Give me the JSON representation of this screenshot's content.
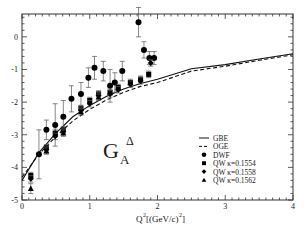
{
  "chart_data": {
    "type": "scatter",
    "title": "",
    "annotation": {
      "main": "G",
      "subscript": "A",
      "superscript": "Δ"
    },
    "xlabel": "Q²[(GeV/c)²]",
    "ylabel": "",
    "xlim": [
      0,
      4
    ],
    "ylim": [
      -5,
      0.7
    ],
    "xticks": [
      0,
      1,
      2,
      3,
      4
    ],
    "yticks": [
      0,
      -1,
      -2,
      -3,
      -4,
      -5
    ],
    "grid": false,
    "legend_position": "lower right",
    "legend": [
      {
        "label": "GBE",
        "style": "solid-line"
      },
      {
        "label": "OGE",
        "style": "dashed-line"
      },
      {
        "label": "DWF",
        "style": "circle"
      },
      {
        "label": "QW κ=0.1554",
        "style": "square"
      },
      {
        "label": "QW κ=0.1558",
        "style": "diamond"
      },
      {
        "label": "QW κ=0.1562",
        "style": "triangle"
      }
    ],
    "series": [
      {
        "name": "GBE",
        "type": "line",
        "dash": false,
        "x": [
          0,
          0.25,
          0.5,
          0.75,
          1.0,
          1.25,
          1.5,
          1.75,
          2.0,
          2.5,
          3.0,
          3.5,
          4.0
        ],
        "y": [
          -4.4,
          -3.55,
          -2.95,
          -2.45,
          -2.1,
          -1.82,
          -1.6,
          -1.43,
          -1.3,
          -0.98,
          -0.85,
          -0.68,
          -0.52
        ]
      },
      {
        "name": "OGE",
        "type": "line",
        "dash": true,
        "x": [
          0,
          0.25,
          0.5,
          0.75,
          1.0,
          1.25,
          1.5,
          1.75,
          2.0,
          2.5,
          3.0,
          3.5,
          4.0
        ],
        "y": [
          -4.3,
          -3.6,
          -3.05,
          -2.58,
          -2.22,
          -1.93,
          -1.7,
          -1.52,
          -1.4,
          -1.05,
          -0.9,
          -0.72,
          -0.55
        ]
      },
      {
        "name": "DWF",
        "marker": "circle",
        "x": [
          0.25,
          0.36,
          0.49,
          0.61,
          0.73,
          0.87,
          0.98,
          1.07,
          1.2,
          1.3,
          1.37,
          1.48,
          1.72,
          1.8,
          1.88,
          1.95
        ],
        "y": [
          -3.6,
          -2.85,
          -2.7,
          -2.45,
          -1.9,
          -1.75,
          -1.25,
          -0.95,
          -1.05,
          -1.5,
          -1.4,
          -1.05,
          0.45,
          -0.4,
          -0.65,
          -0.65
        ],
        "err": [
          0.75,
          0.3,
          0.65,
          0.5,
          0.4,
          0.35,
          0.3,
          0.35,
          0.3,
          0.5,
          0.3,
          0.3,
          0.45,
          0.25,
          0.2,
          0.2
        ]
      },
      {
        "name": "QW κ=0.1554",
        "marker": "square",
        "x": [
          0.13,
          0.36,
          0.49,
          0.61,
          0.87,
          1.0,
          1.13,
          1.3,
          1.42,
          1.6,
          1.75,
          1.87
        ],
        "y": [
          -4.25,
          -3.4,
          -2.95,
          -2.85,
          -2.2,
          -1.95,
          -1.75,
          -1.7,
          -1.55,
          -1.4,
          -1.3,
          -1.15
        ],
        "err": [
          0.1,
          0.1,
          0.12,
          0.1,
          0.1,
          0.1,
          0.1,
          0.1,
          0.1,
          0.1,
          0.1,
          0.1
        ]
      },
      {
        "name": "QW κ=0.1558",
        "marker": "diamond",
        "x": [
          0.13,
          0.36,
          0.49,
          0.61,
          0.87,
          1.0,
          1.13,
          1.3,
          1.42,
          1.6,
          1.75,
          1.9
        ],
        "y": [
          -4.35,
          -3.45,
          -3.05,
          -2.9,
          -2.25,
          -2.05,
          -1.8,
          -1.75,
          -1.62,
          -1.45,
          -1.35,
          -0.8
        ],
        "err": [
          0.1,
          0.1,
          0.1,
          0.1,
          0.1,
          0.1,
          0.1,
          0.1,
          0.1,
          0.1,
          0.1,
          0.1
        ]
      },
      {
        "name": "QW κ=0.1562",
        "marker": "triangle",
        "x": [
          0.13,
          0.36,
          0.61,
          0.87,
          1.13
        ],
        "y": [
          -4.65,
          -3.5,
          -2.95,
          -2.3,
          -1.85
        ],
        "err": [
          0.15,
          0.1,
          0.1,
          0.1,
          0.1
        ]
      }
    ]
  },
  "labels": {
    "x_axis": "Q²[(GeV/c)²]",
    "x_axis_main": "Q",
    "x_axis_rest": "[(GeV/c)",
    "x_axis_end": "]",
    "sup2": "2",
    "annot_G": "G",
    "annot_sub": "A",
    "annot_sup": "Δ"
  }
}
